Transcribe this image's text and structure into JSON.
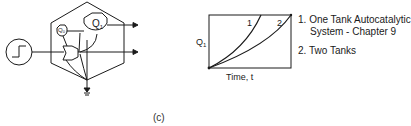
{
  "diagram": {
    "components": {
      "step_input_label": "step-input",
      "tank_q1_label": "Q1",
      "tank_q1_main": "Q",
      "tank_q1_sub": "1",
      "tank_q0_main": "Q",
      "tank_q0_sub": "0",
      "ground_label": "ground"
    }
  },
  "chart_data": {
    "type": "line",
    "title": "",
    "xlabel": "Time, t",
    "ylabel_main": "Q",
    "ylabel_sub": "1",
    "series": [
      {
        "name": "1",
        "label": "1",
        "description": "One Tank Autocatalytic System - Chapter 9",
        "shape": "steep convex growth"
      },
      {
        "name": "2",
        "label": "2",
        "description": "Two Tanks",
        "shape": "slower convex growth"
      }
    ],
    "legend": [
      {
        "number": "1.",
        "line1": "One Tank Autocatalytic",
        "line2": "System - Chapter 9"
      },
      {
        "number": "2.",
        "line1": "Two Tanks"
      }
    ],
    "legend_position": "right",
    "grid": false
  },
  "caption": "(c)"
}
